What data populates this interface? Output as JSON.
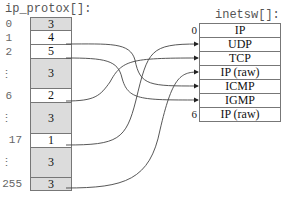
{
  "left_table": {
    "title": "ip_protox[]:",
    "rows": [
      {
        "index": "0",
        "value": "3",
        "shaded": true
      },
      {
        "index": "1",
        "value": "4",
        "shaded": false
      },
      {
        "index": "2",
        "value": "5",
        "shaded": false
      },
      {
        "index": "⋮",
        "value": "3",
        "shaded": true
      },
      {
        "index": "6",
        "value": "2",
        "shaded": false
      },
      {
        "index": "⋮",
        "value": "3",
        "shaded": true
      },
      {
        "index": "17",
        "value": "1",
        "shaded": false
      },
      {
        "index": "⋮",
        "value": "3",
        "shaded": true
      },
      {
        "index": "255",
        "value": "3",
        "shaded": true
      }
    ]
  },
  "right_table": {
    "title": "inetsw[]:",
    "first_index": "0",
    "last_index": "6",
    "rows": [
      "IP",
      "UDP",
      "TCP",
      "IP (raw)",
      "ICMP",
      "IGMP",
      "IP (raw)"
    ]
  },
  "arrows": [
    {
      "from": "1",
      "to": "ICMP"
    },
    {
      "from": "2",
      "to": "IGMP"
    },
    {
      "from": "6",
      "to": "TCP"
    },
    {
      "from": "17",
      "to": "UDP"
    },
    {
      "from": "255",
      "to": "IP (raw)"
    }
  ]
}
